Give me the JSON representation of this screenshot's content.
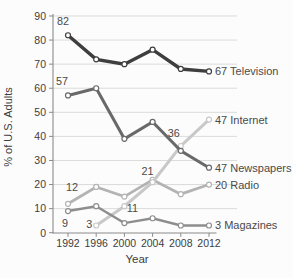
{
  "chart_data": {
    "type": "line",
    "title": "",
    "xlabel": "Year",
    "ylabel": "% of U.S. Adults",
    "x": [
      1992,
      1996,
      2000,
      2004,
      2008,
      2012
    ],
    "xlim": [
      1992,
      2012
    ],
    "ylim": [
      0,
      90
    ],
    "yticks": [
      0,
      10,
      20,
      30,
      40,
      50,
      60,
      70,
      80,
      90
    ],
    "grid": "horizontal",
    "legend_position": "end-of-line-labels",
    "series": [
      {
        "name": "Radio",
        "color": "#b3b3b3",
        "line_width": 2.8,
        "values": [
          12,
          19,
          15,
          22,
          16,
          20
        ]
      },
      {
        "name": "Internet",
        "color": "#c8c8c8",
        "line_width": 3.0,
        "values": [
          null,
          3,
          11,
          21,
          36,
          47
        ]
      },
      {
        "name": "Magazines",
        "color": "#8d8d8d",
        "line_width": 2.4,
        "values": [
          9,
          11,
          4,
          6,
          3,
          3
        ]
      },
      {
        "name": "Newspapers",
        "color": "#696969",
        "line_width": 3.0,
        "values": [
          57,
          60,
          39,
          46,
          34,
          27
        ]
      },
      {
        "name": "Television",
        "color": "#3e3e3e",
        "line_width": 3.4,
        "values": [
          82,
          72,
          70,
          76,
          68,
          67
        ]
      }
    ],
    "annotations": [
      {
        "text": "82",
        "year": 1992,
        "value": 82,
        "dx": -5,
        "dy": -10,
        "anchor": "middle"
      },
      {
        "text": "57",
        "year": 1992,
        "value": 57,
        "dx": -6,
        "dy": -10,
        "anchor": "middle"
      },
      {
        "text": "12",
        "year": 1992,
        "value": 12,
        "dx": 4,
        "dy": -13,
        "anchor": "middle"
      },
      {
        "text": "9",
        "year": 1992,
        "value": 9,
        "dx": -3,
        "dy": 16,
        "anchor": "middle"
      },
      {
        "text": "3",
        "year": 1996,
        "value": 3,
        "dx": -7,
        "dy": 3,
        "anchor": "middle"
      },
      {
        "text": "11",
        "year": 2000,
        "value": 11,
        "dx": 8,
        "dy": 6,
        "anchor": "middle"
      },
      {
        "text": "21",
        "year": 2004,
        "value": 21,
        "dx": -5,
        "dy": -7,
        "anchor": "middle"
      },
      {
        "text": "36",
        "year": 2008,
        "value": 36,
        "dx": -7,
        "dy": -9,
        "anchor": "middle"
      },
      {
        "text": "67 Television",
        "year": 2012,
        "value": 67,
        "dx": 6,
        "dy": 4,
        "anchor": "start"
      },
      {
        "text": "47 Internet",
        "year": 2012,
        "value": 47,
        "dx": 6,
        "dy": 4,
        "anchor": "start"
      },
      {
        "text": "47 Newspapers",
        "year": 2012,
        "value": 27,
        "dx": 6,
        "dy": 4,
        "anchor": "start"
      },
      {
        "text": "20 Radio",
        "year": 2012,
        "value": 20,
        "dx": 6,
        "dy": 4,
        "anchor": "start"
      },
      {
        "text": "3 Magazines",
        "year": 2012,
        "value": 3,
        "dx": 6,
        "dy": 4,
        "anchor": "start"
      }
    ],
    "colors": {
      "grid": "#d7d7d7",
      "axis": "#8a8a8a",
      "tick_text": "#3d3d3d",
      "annotation_text": "#4a4a4a",
      "marker_fill": "#ffffff",
      "background": "#fcfcfc"
    }
  }
}
